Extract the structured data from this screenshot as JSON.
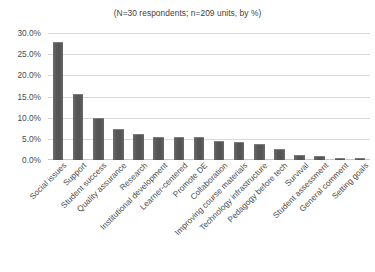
{
  "chart_data": {
    "type": "bar",
    "title": "(N=30 respondents; n=209 units, by %)",
    "xlabel": "",
    "ylabel": "",
    "ylim": [
      0,
      30
    ],
    "grid": true,
    "legend": "none",
    "orientation": "vertical",
    "bar_color": "#565656",
    "gridline_color": "#d9d9d9",
    "yticks": [
      "0.0%",
      "5.0%",
      "10.0%",
      "15.0%",
      "20.0%",
      "25.0%",
      "30.0%"
    ],
    "ytick_values": [
      0,
      5,
      10,
      15,
      20,
      25,
      30
    ],
    "categories": [
      "Social issues",
      "Support",
      "Student success",
      "Quality assurance",
      "Research",
      "Institutional development",
      "Learner-centered",
      "Promote DE",
      "Collaboration",
      "Improving course materials",
      "Technology infrastructure",
      "Pedagogy before tech",
      "Survival",
      "Student assessment",
      "General comment",
      "Setting goals"
    ],
    "values": [
      27.8,
      15.5,
      9.9,
      7.4,
      6.1,
      5.5,
      5.5,
      5.5,
      4.5,
      4.3,
      3.9,
      2.6,
      1.2,
      1.0,
      0.4,
      0.4
    ]
  }
}
